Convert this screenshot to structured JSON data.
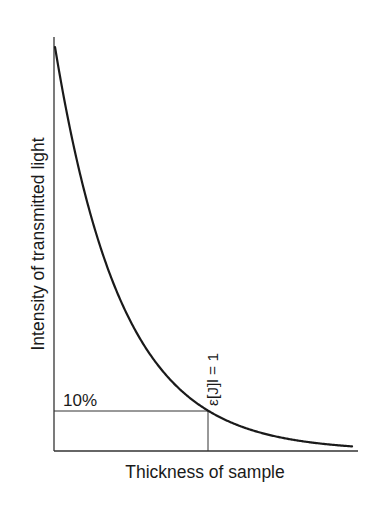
{
  "chart_data": {
    "type": "line",
    "title": "",
    "xlabel": "Thickness of sample",
    "ylabel": "Intensity of transmitted light",
    "grid": false,
    "legend": null,
    "series": [
      {
        "name": "Transmitted intensity (exponential decay, Beer-Lambert)",
        "x": [
          0,
          0.25,
          0.5,
          0.75,
          1.0,
          1.25,
          1.5,
          1.75,
          1.94
        ],
        "values": [
          100,
          56.2,
          31.6,
          17.8,
          10.0,
          5.6,
          3.2,
          1.8,
          1.1
        ]
      }
    ],
    "annotations": [
      {
        "text": "10%",
        "type": "horizontal-reference",
        "y": 10,
        "x_range": [
          0,
          1.0
        ]
      },
      {
        "text": "ε[J]l = 1",
        "type": "vertical-reference",
        "x": 1.0,
        "y_range": [
          0,
          10
        ],
        "rotated": true
      }
    ],
    "xlim": [
      0,
      2.0
    ],
    "ylim": [
      0,
      100
    ],
    "ticks": {
      "x": [],
      "y": []
    }
  },
  "labels": {
    "x_axis": "Thickness of sample",
    "y_axis": "Intensity of transmitted light",
    "ten_percent": "10%",
    "epsilon_label": "ε[J]l = 1"
  },
  "colors": {
    "curve": "#1a1a1a",
    "axis": "#333333",
    "background": "#ffffff"
  }
}
